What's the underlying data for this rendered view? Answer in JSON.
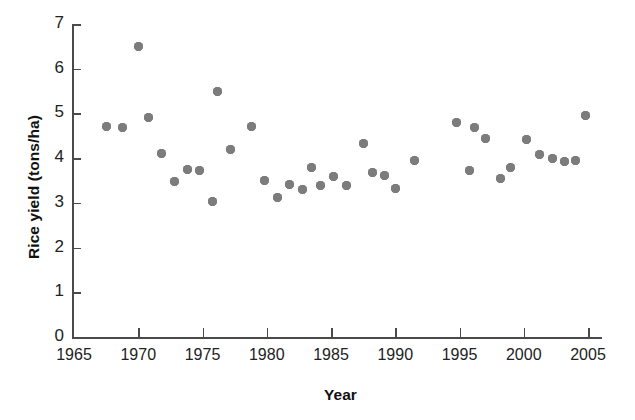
{
  "chart_data": {
    "type": "scatter",
    "title": "",
    "xlabel": "Year",
    "ylabel": "Rice yield (tons/ha)",
    "xlim": [
      1965,
      2005
    ],
    "ylim": [
      0,
      7
    ],
    "xticks": [
      1965,
      1970,
      1975,
      1980,
      1985,
      1990,
      1995,
      2000,
      2005
    ],
    "xtick_labels": [
      "1965",
      "1970",
      "1975",
      "1980",
      "1985",
      "1990",
      "1995",
      "2000",
      "2005"
    ],
    "yticks": [
      0,
      1,
      2,
      3,
      4,
      5,
      6,
      7
    ],
    "ytick_labels": [
      "0",
      "1",
      "2",
      "3",
      "4",
      "5",
      "6",
      "7"
    ],
    "grid": false,
    "legend": null,
    "marker": {
      "shape": "circle",
      "color": "#7c7c7c",
      "size": 9
    },
    "points": [
      {
        "x": 1967.5,
        "y": 4.7
      },
      {
        "x": 1968.8,
        "y": 4.68
      },
      {
        "x": 1970.0,
        "y": 6.5
      },
      {
        "x": 1970.8,
        "y": 4.92
      },
      {
        "x": 1971.8,
        "y": 4.1
      },
      {
        "x": 1972.8,
        "y": 3.48
      },
      {
        "x": 1973.8,
        "y": 3.75
      },
      {
        "x": 1974.8,
        "y": 3.73
      },
      {
        "x": 1975.8,
        "y": 3.03
      },
      {
        "x": 1976.2,
        "y": 5.5
      },
      {
        "x": 1977.2,
        "y": 4.2
      },
      {
        "x": 1978.8,
        "y": 4.7
      },
      {
        "x": 1979.8,
        "y": 3.5
      },
      {
        "x": 1980.8,
        "y": 3.13
      },
      {
        "x": 1981.8,
        "y": 3.42
      },
      {
        "x": 1982.8,
        "y": 3.3
      },
      {
        "x": 1983.5,
        "y": 3.8
      },
      {
        "x": 1984.2,
        "y": 3.38
      },
      {
        "x": 1985.2,
        "y": 3.6
      },
      {
        "x": 1986.2,
        "y": 3.38
      },
      {
        "x": 1987.5,
        "y": 4.32
      },
      {
        "x": 1988.2,
        "y": 3.68
      },
      {
        "x": 1989.2,
        "y": 3.62
      },
      {
        "x": 1990.0,
        "y": 3.32
      },
      {
        "x": 1991.5,
        "y": 3.95
      },
      {
        "x": 1994.8,
        "y": 4.8
      },
      {
        "x": 1995.8,
        "y": 3.72
      },
      {
        "x": 1996.2,
        "y": 4.68
      },
      {
        "x": 1997.0,
        "y": 4.45
      },
      {
        "x": 1998.2,
        "y": 3.55
      },
      {
        "x": 1999.0,
        "y": 3.78
      },
      {
        "x": 2000.2,
        "y": 4.42
      },
      {
        "x": 2001.2,
        "y": 4.08
      },
      {
        "x": 2002.2,
        "y": 4.0
      },
      {
        "x": 2003.2,
        "y": 3.92
      },
      {
        "x": 2004.0,
        "y": 3.95
      },
      {
        "x": 2004.8,
        "y": 4.95
      }
    ]
  }
}
